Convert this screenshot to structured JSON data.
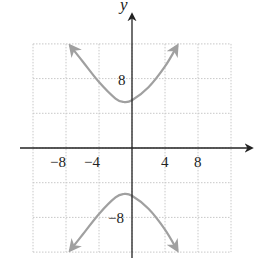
{
  "chart_data": {
    "type": "line",
    "title": "",
    "xlabel": "",
    "ylabel": "y",
    "xlim": [
      -12,
      12
    ],
    "ylim": [
      -12,
      12
    ],
    "grid": true,
    "grid_step": 4,
    "x_ticks": [
      {
        "value": -8,
        "label": "−8"
      },
      {
        "value": -4,
        "label": "−4"
      },
      {
        "value": 4,
        "label": "4"
      },
      {
        "value": 8,
        "label": "8"
      }
    ],
    "y_ticks": [
      {
        "value": 8,
        "label": "8"
      },
      {
        "value": -8,
        "label": "−8"
      }
    ],
    "series": [
      {
        "name": "upper branch",
        "description": "upper branch of a vertical hyperbola, vertex near (-1, 5.3), opening upward, arrows at both ends",
        "x": [
          -7.5,
          -6,
          -4,
          -2,
          -1,
          0,
          2,
          4,
          5.5
        ],
        "y": [
          11.8,
          10.0,
          7.6,
          5.7,
          5.3,
          5.5,
          7.0,
          9.4,
          11.8
        ]
      },
      {
        "name": "lower branch",
        "description": "lower branch of a vertical hyperbola, vertex near (-1, -5.3), opening downward, arrows at both ends",
        "x": [
          -7.5,
          -6,
          -4,
          -2,
          -1,
          0,
          2,
          4,
          5.5
        ],
        "y": [
          -11.8,
          -10.0,
          -7.6,
          -5.7,
          -5.3,
          -5.5,
          -7.0,
          -9.4,
          -11.8
        ]
      }
    ],
    "colors": {
      "curve": "#a0a0a0",
      "axis": "#222222",
      "grid": "#c8c8c8"
    }
  },
  "labels": {
    "y_axis_title": "y",
    "x_tick_neg8": "−8",
    "x_tick_neg4": "−4",
    "x_tick_4": "4",
    "x_tick_8": "8",
    "y_tick_8": "8",
    "y_tick_neg8": "−8"
  }
}
